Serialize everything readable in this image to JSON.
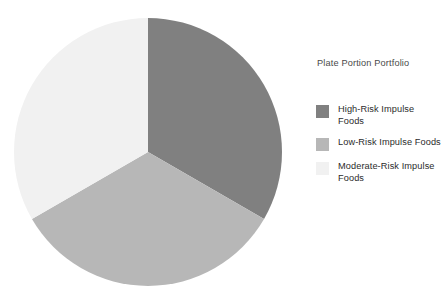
{
  "chart_data": {
    "type": "pie",
    "title": "Plate Portion Portfolio",
    "categories": [
      "High-Risk Impulse Foods",
      "Low-Risk Impulse Foods",
      "Moderate-Risk Impulse Foods"
    ],
    "values": [
      33.3,
      33.3,
      33.3
    ],
    "colors": [
      "#808080",
      "#b7b7b7",
      "#f1f1f1"
    ],
    "start_angle_deg": 0,
    "direction": "clockwise",
    "legend_position": "right",
    "grid": false,
    "xlabel": "",
    "ylabel": "",
    "data_labels_shown": false
  },
  "legend": {
    "title": "Plate Portion Portfolio",
    "items": [
      {
        "label": "High-Risk Impulse Foods",
        "color": "#808080"
      },
      {
        "label": "Low-Risk Impulse Foods",
        "color": "#b7b7b7"
      },
      {
        "label": "Moderate-Risk Impulse Foods",
        "color": "#f1f1f1"
      }
    ]
  },
  "pie": {
    "center_x": 148,
    "center_y": 152,
    "radius": 134,
    "slices": [
      {
        "name": "High-Risk Impulse Foods",
        "value": 33.3,
        "color": "#808080",
        "start_deg": 0,
        "end_deg": 120
      },
      {
        "name": "Low-Risk Impulse Foods",
        "value": 33.3,
        "color": "#b7b7b7",
        "start_deg": 120,
        "end_deg": 240
      },
      {
        "name": "Moderate-Risk Impulse Foods",
        "value": 33.3,
        "color": "#f1f1f1",
        "start_deg": 240,
        "end_deg": 360
      }
    ]
  }
}
